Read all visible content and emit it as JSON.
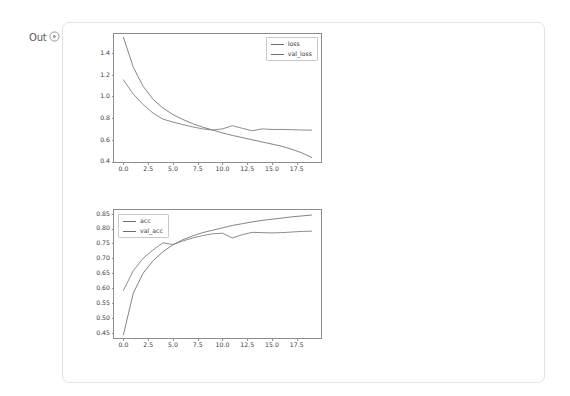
{
  "prompt": {
    "label": "Out",
    "icon": "circled-play-icon"
  },
  "colors": {
    "series_a": "#6e6e6e",
    "series_b": "#787878",
    "axis": "#8d8d8d",
    "tick_text": "#3c3c3c",
    "card_border": "#e2e2e2",
    "page_background": "#ffffff"
  },
  "chart_data": [
    {
      "type": "line",
      "id": "loss-chart",
      "title": "",
      "xlabel": "",
      "ylabel": "",
      "xlim": [
        -0.95,
        19.95
      ],
      "ylim": [
        0.395,
        1.575
      ],
      "grid": false,
      "legend_position": "upper right",
      "xticks": [
        "0.0",
        "2.5",
        "5.0",
        "7.5",
        "10.0",
        "12.5",
        "15.0",
        "17.5"
      ],
      "xtick_values": [
        0.0,
        2.5,
        5.0,
        7.5,
        10.0,
        12.5,
        15.0,
        17.5
      ],
      "yticks": [
        "0.4",
        "0.6",
        "0.8",
        "1.0",
        "1.2",
        "1.4"
      ],
      "ytick_values": [
        0.4,
        0.6,
        0.8,
        1.0,
        1.2,
        1.4
      ],
      "x": [
        0,
        1,
        2,
        3,
        4,
        5,
        6,
        7,
        8,
        9,
        10,
        11,
        12,
        13,
        14,
        15,
        16,
        17,
        18,
        19
      ],
      "series": [
        {
          "name": "loss",
          "values": [
            1.545,
            1.268,
            1.092,
            0.972,
            0.892,
            0.832,
            0.787,
            0.748,
            0.716,
            0.69,
            0.663,
            0.64,
            0.62,
            0.6,
            0.58,
            0.56,
            0.54,
            0.512,
            0.48,
            0.437
          ]
        },
        {
          "name": "val_loss",
          "values": [
            1.152,
            1.02,
            0.925,
            0.845,
            0.79,
            0.763,
            0.74,
            0.718,
            0.7,
            0.69,
            0.7,
            0.73,
            0.706,
            0.683,
            0.7,
            0.695,
            0.695,
            0.693,
            0.69,
            0.688
          ]
        }
      ]
    },
    {
      "type": "line",
      "id": "accuracy-chart",
      "title": "",
      "xlabel": "",
      "ylabel": "",
      "xlim": [
        -0.95,
        19.95
      ],
      "ylim": [
        0.432,
        0.862
      ],
      "grid": false,
      "legend_position": "upper left",
      "xticks": [
        "0.0",
        "2.5",
        "5.0",
        "7.5",
        "10.0",
        "12.5",
        "15.0",
        "17.5"
      ],
      "xtick_values": [
        0.0,
        2.5,
        5.0,
        7.5,
        10.0,
        12.5,
        15.0,
        17.5
      ],
      "yticks": [
        "0.45",
        "0.50",
        "0.55",
        "0.60",
        "0.65",
        "0.70",
        "0.75",
        "0.80",
        "0.85"
      ],
      "ytick_values": [
        0.45,
        0.5,
        0.55,
        0.6,
        0.65,
        0.7,
        0.75,
        0.8,
        0.85
      ],
      "x": [
        0,
        1,
        2,
        3,
        4,
        5,
        6,
        7,
        8,
        9,
        10,
        11,
        12,
        13,
        14,
        15,
        16,
        17,
        18,
        19
      ],
      "series": [
        {
          "name": "acc",
          "values": [
            0.443,
            0.583,
            0.65,
            0.692,
            0.722,
            0.745,
            0.762,
            0.775,
            0.786,
            0.794,
            0.802,
            0.81,
            0.816,
            0.822,
            0.827,
            0.831,
            0.835,
            0.839,
            0.842,
            0.845
          ]
        },
        {
          "name": "val_acc",
          "values": [
            0.592,
            0.658,
            0.7,
            0.728,
            0.752,
            0.746,
            0.758,
            0.768,
            0.776,
            0.782,
            0.784,
            0.768,
            0.779,
            0.787,
            0.786,
            0.785,
            0.786,
            0.788,
            0.79,
            0.791
          ]
        }
      ]
    }
  ]
}
